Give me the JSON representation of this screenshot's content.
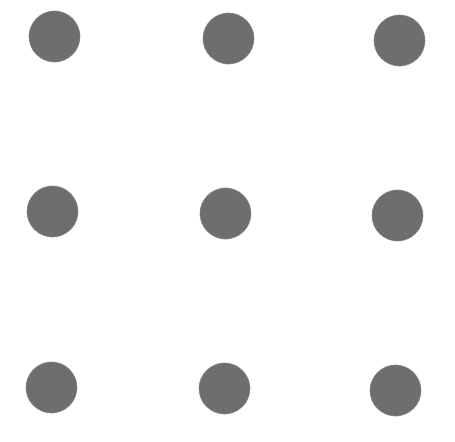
{
  "diagram": {
    "type": "dot-grid",
    "rows": 3,
    "cols": 3,
    "background": "#ffffff",
    "dot_color": "#6e6e6e",
    "dot_diameter": 51,
    "dots": [
      {
        "row": 1,
        "col": 1,
        "cx": 54,
        "cy": 36
      },
      {
        "row": 1,
        "col": 2,
        "cx": 228,
        "cy": 38
      },
      {
        "row": 1,
        "col": 3,
        "cx": 399,
        "cy": 40
      },
      {
        "row": 2,
        "col": 1,
        "cx": 52,
        "cy": 211
      },
      {
        "row": 2,
        "col": 2,
        "cx": 225,
        "cy": 213
      },
      {
        "row": 2,
        "col": 3,
        "cx": 397,
        "cy": 215
      },
      {
        "row": 3,
        "col": 1,
        "cx": 51,
        "cy": 387
      },
      {
        "row": 3,
        "col": 2,
        "cx": 224,
        "cy": 388
      },
      {
        "row": 3,
        "col": 3,
        "cx": 395,
        "cy": 390
      }
    ]
  }
}
